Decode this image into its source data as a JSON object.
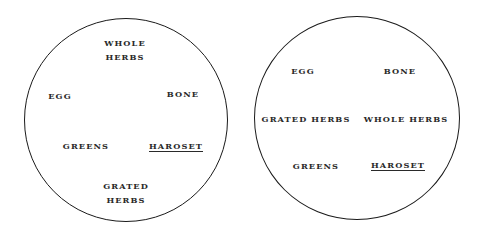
{
  "diagrams": [
    {
      "name": "plate-arrangement-1",
      "circle": {
        "cx": 126,
        "cy": 120,
        "r": 102
      },
      "labels": {
        "whole_herbs": [
          "WHOLE",
          "HERBS"
        ],
        "egg": "EGG",
        "bone": "BONE",
        "greens": "GREENS",
        "haroset": "HAROSET",
        "grated_herbs": [
          "GRATED",
          "HERBS"
        ]
      }
    },
    {
      "name": "plate-arrangement-2",
      "circle": {
        "cx": 358,
        "cy": 118,
        "r": 102
      },
      "labels": {
        "egg": "EGG",
        "bone": "BONE",
        "grated_herbs": "GRATED HERBS",
        "whole_herbs": "WHOLE HERBS",
        "greens": "GREENS",
        "haroset": "HAROSET"
      }
    }
  ],
  "colors": {
    "ink": "#1a1a1a",
    "background": "#ffffff"
  }
}
